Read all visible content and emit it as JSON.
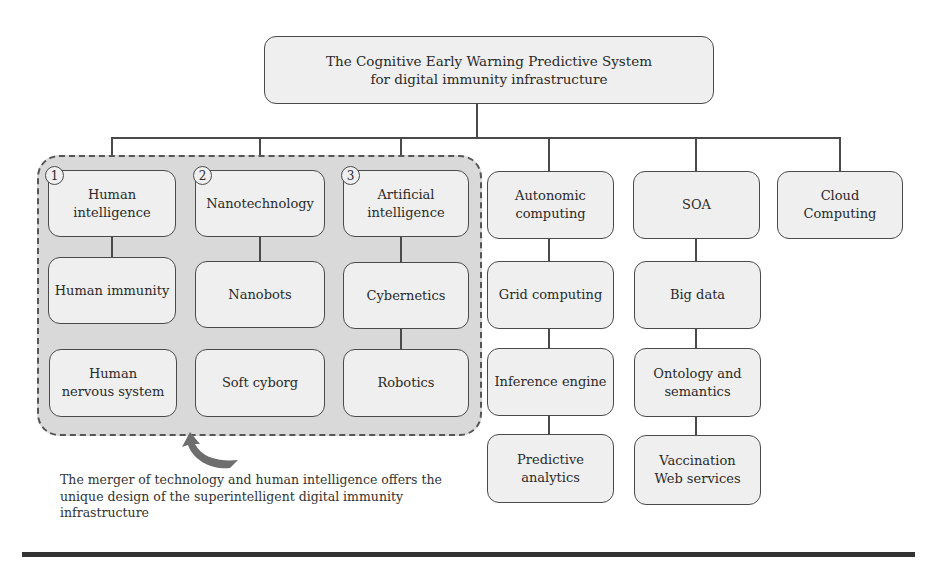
{
  "title": "The Cognitive Early Warning Predictive System\nfor digital immunity infrastructure",
  "group": {
    "badges": [
      "1",
      "2",
      "3"
    ],
    "columns": [
      {
        "items": [
          "Human\nintelligence",
          "Human immunity",
          "Human\nnervous system"
        ]
      },
      {
        "items": [
          "Nanotechnology",
          "Nanobots",
          "Soft cyborg"
        ]
      },
      {
        "items": [
          "Artificial\nintelligence",
          "Cybernetics",
          "Robotics"
        ]
      }
    ]
  },
  "columns": [
    {
      "items": [
        "Autonomic\ncomputing",
        "Grid computing",
        "Inference engine",
        "Predictive\nanalytics"
      ]
    },
    {
      "items": [
        "SOA",
        "Big data",
        "Ontology and\nsemantics",
        "Vaccination\nWeb services"
      ]
    },
    {
      "items": [
        "Cloud\nComputing"
      ]
    }
  ],
  "caption": "The merger of technology and human intelligence offers the unique design of the superintelligent digital immunity infrastructure",
  "colors": {
    "box_fill": "#efefef",
    "group_fill": "#d9d9d9",
    "line": "#4a4a4a",
    "arrow": "#6e6e6e"
  }
}
